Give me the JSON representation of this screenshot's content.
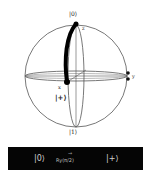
{
  "diagram": {
    "type": "bloch-sphere",
    "labels": {
      "north": "|0⟩",
      "south": "|1⟩",
      "z_axis": "z",
      "x_axis": "x",
      "y_axis": "y",
      "final_state": "|+⟩"
    },
    "rotation_path": {
      "from": "|0⟩",
      "to": "|+⟩",
      "color": "#000000"
    },
    "colors": {
      "sphere_outline": "#444444",
      "path": "#000000",
      "background": "#ffffff"
    }
  },
  "operation_bar": {
    "initial_state": "|0⟩",
    "gate": "Ry(π/2)",
    "arrow": "→",
    "final_state": "|+⟩",
    "background": "#050505"
  }
}
